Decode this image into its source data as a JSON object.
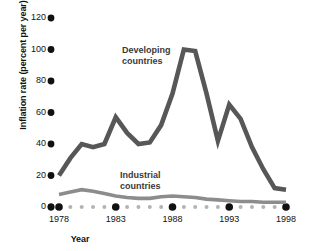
{
  "chart_data": {
    "type": "line",
    "title": "",
    "xlabel": "Year",
    "ylabel": "Inflation rate (percent per year)",
    "xlim": [
      1978,
      1998
    ],
    "ylim": [
      0,
      120
    ],
    "grid": false,
    "legend_position": "inline-annotations",
    "yticks": [
      0,
      20,
      40,
      60,
      80,
      100,
      120
    ],
    "ytick_labels": [
      "0",
      "20",
      "40",
      "60",
      "80",
      "100",
      "120"
    ],
    "xticks": [
      1978,
      1983,
      1988,
      1993,
      1998
    ],
    "xtick_labels": [
      "1978",
      "1983",
      "1988",
      "1993",
      "1998"
    ],
    "x": [
      1978,
      1979,
      1980,
      1981,
      1982,
      1983,
      1984,
      1985,
      1986,
      1987,
      1988,
      1989,
      1990,
      1991,
      1992,
      1993,
      1994,
      1995,
      1996,
      1997,
      1998
    ],
    "series": [
      {
        "name": "Developing countries",
        "color": "#575757",
        "values": [
          20,
          31,
          40,
          38,
          40,
          57,
          47,
          40,
          41,
          52,
          72,
          100,
          99,
          72,
          42,
          65,
          56,
          38,
          24,
          12,
          11
        ]
      },
      {
        "name": "Industrial countries",
        "color": "#8c8c8c",
        "values": [
          8,
          9.5,
          11,
          10,
          8.5,
          7,
          6,
          5.5,
          5.5,
          6.5,
          7,
          6.5,
          6,
          5,
          4.5,
          4,
          3.5,
          3.5,
          3,
          3,
          3
        ]
      }
    ],
    "annotations": [
      {
        "text_line1": "Developing",
        "text_line2": "countries",
        "series": "Developing countries"
      },
      {
        "text_line1": "Industrial",
        "text_line2": "countries",
        "series": "Industrial countries"
      }
    ],
    "axis_marker_color": "#111111",
    "minor_tick_color": "#b3b3b3"
  }
}
